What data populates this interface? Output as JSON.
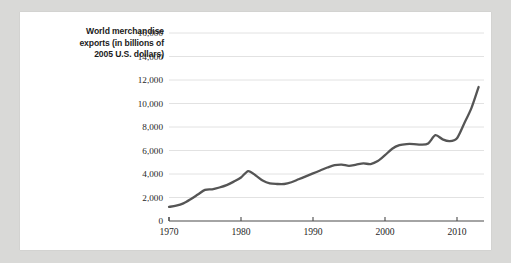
{
  "chart_data": {
    "type": "line",
    "title": "",
    "subtitle": "",
    "xlabel": "",
    "ylabel": "World merchandise exports (in billions of 2005 U.S. dollars)",
    "ylabel_lines": [
      "World merchandise",
      "exports (in billions of",
      "2005 U.S. dollars)"
    ],
    "grid": true,
    "legend": "none",
    "xlim": [
      1970,
      2013
    ],
    "ylim": [
      0,
      16000
    ],
    "y_ticks": [
      0,
      2000,
      4000,
      6000,
      8000,
      10000,
      12000,
      14000,
      16000
    ],
    "y_tick_labels": [
      "0",
      "2,000",
      "4,000",
      "6,000",
      "8,000",
      "10,000",
      "12,000",
      "14,000",
      "16,000"
    ],
    "x_ticks": [
      1970,
      1980,
      1990,
      2000,
      2010
    ],
    "x_tick_labels": [
      "1970",
      "1980",
      "1990",
      "2000",
      "2010"
    ],
    "series": [
      {
        "name": "World merchandise exports",
        "color": "#555555",
        "x": [
          1970,
          1971,
          1972,
          1973,
          1974,
          1975,
          1976,
          1977,
          1978,
          1979,
          1980,
          1981,
          1982,
          1983,
          1984,
          1985,
          1986,
          1987,
          1988,
          1989,
          1990,
          1991,
          1992,
          1993,
          1994,
          1995,
          1996,
          1997,
          1998,
          1999,
          2000,
          2001,
          2002,
          2003,
          2004,
          2005,
          2006,
          2007,
          2008,
          2009,
          2010,
          2011,
          2012,
          2013
        ],
        "values": [
          1200,
          1300,
          1500,
          1850,
          2250,
          2650,
          2700,
          2850,
          3050,
          3350,
          3700,
          4250,
          3900,
          3450,
          3200,
          3150,
          3150,
          3300,
          3550,
          3800,
          4050,
          4300,
          4550,
          4750,
          4800,
          4700,
          4800,
          4900,
          4850,
          5100,
          5600,
          6150,
          6450,
          6550,
          6550,
          6500,
          6600,
          7300,
          6950,
          6800,
          7050,
          8300,
          9600,
          11400
        ]
      }
    ],
    "series_note": "values in billions of 2005 U.S. dollars",
    "annotations": [
      {
        "label": "2008 peak",
        "x": 2008,
        "y": 14750
      },
      {
        "label": "2009 trough",
        "x": 2009,
        "y": 11550
      },
      {
        "label": "2013 end",
        "x": 2013,
        "y": 15950
      }
    ],
    "colors": {
      "line": "#555555",
      "grid": "#e2e2e2",
      "axis": "#4a4a4a",
      "text": "#1f1f1f",
      "card_background": "#ffffff",
      "page_background": "#d9d9d7"
    }
  }
}
